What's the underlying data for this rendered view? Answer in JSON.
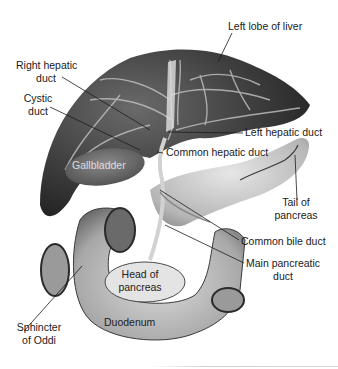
{
  "figure": {
    "style": "grayscale illustration"
  },
  "labels": {
    "left_lobe_of_liver": "Left lobe of liver",
    "right_hepatic_duct_line1": "Right hepatic",
    "right_hepatic_duct_line2": "duct",
    "cystic_duct_line1": "Cystic",
    "cystic_duct_line2": "duct",
    "left_hepatic_duct": "Left hepatic duct",
    "common_hepatic_duct": "Common hepatic duct",
    "gallbladder": "Gallbladder",
    "tail_of_pancreas_line1": "Tail of",
    "tail_of_pancreas_line2": "pancreas",
    "common_bile_duct": "Common bile duct",
    "main_pancreatic_duct_line1": "Main pancreatic",
    "main_pancreatic_duct_line2": "duct",
    "head_of_pancreas_line1": "Head of",
    "head_of_pancreas_line2": "pancreas",
    "duodenum": "Duodenum",
    "sphincter_of_oddi_line1": "Sphincter",
    "sphincter_of_oddi_line2": "of Oddi"
  },
  "colors": {
    "liver_dark": "#2b2b2b",
    "liver_mid": "#555555",
    "duct_light": "#c8c8c8",
    "pancreas": "#bdbdbd",
    "duodenum": "#a9a9a9",
    "leader_line": "#1a1a1a"
  }
}
